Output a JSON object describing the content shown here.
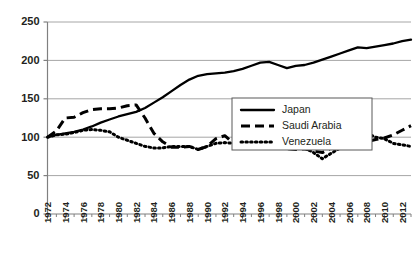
{
  "chart_data": {
    "type": "line",
    "title": "",
    "xlabel": "",
    "ylabel": "",
    "xlim": [
      1972,
      2013
    ],
    "ylim": [
      0,
      250
    ],
    "grid": true,
    "y_ticks": [
      0,
      50,
      100,
      150,
      200,
      250
    ],
    "x_ticks": [
      1972,
      1974,
      1976,
      1978,
      1980,
      1982,
      1984,
      1986,
      1988,
      1990,
      1992,
      1994,
      1996,
      1998,
      2000,
      2002,
      2004,
      2006,
      2008,
      2010,
      2012
    ],
    "x": [
      1972,
      1973,
      1974,
      1975,
      1976,
      1977,
      1978,
      1979,
      1980,
      1981,
      1982,
      1983,
      1984,
      1985,
      1986,
      1987,
      1988,
      1989,
      1990,
      1991,
      1992,
      1993,
      1994,
      1995,
      1996,
      1997,
      1998,
      1999,
      2000,
      2001,
      2002,
      2003,
      2004,
      2005,
      2006,
      2007,
      2008,
      2009,
      2010,
      2011,
      2012,
      2013
    ],
    "legend_position": "center-right",
    "series": [
      {
        "name": "Japan",
        "style": "solid",
        "color": "#000000",
        "values": [
          100,
          103,
          105,
          107,
          110,
          114,
          119,
          123,
          127,
          130,
          133,
          138,
          145,
          152,
          160,
          168,
          175,
          180,
          182,
          183,
          184,
          186,
          189,
          193,
          197,
          198,
          194,
          190,
          193,
          194,
          197,
          201,
          205,
          209,
          213,
          217,
          216,
          218,
          220,
          222,
          225,
          227
        ]
      },
      {
        "name": "Saudi Arabia",
        "style": "dashed",
        "color": "#000000",
        "values": [
          100,
          108,
          125,
          126,
          132,
          136,
          137,
          137,
          138,
          141,
          142,
          125,
          105,
          94,
          87,
          87,
          88,
          84,
          88,
          98,
          102,
          92,
          89,
          89,
          87,
          88,
          88,
          85,
          84,
          85,
          82,
          80,
          86,
          88,
          90,
          92,
          94,
          97,
          99,
          103,
          109,
          115
        ]
      },
      {
        "name": "Venezuela",
        "style": "dotted",
        "color": "#000000",
        "values": [
          100,
          103,
          104,
          106,
          109,
          110,
          109,
          107,
          100,
          96,
          92,
          88,
          86,
          86,
          88,
          88,
          88,
          84,
          88,
          92,
          93,
          92,
          90,
          89,
          90,
          91,
          88,
          86,
          85,
          86,
          80,
          72,
          79,
          86,
          93,
          101,
          105,
          100,
          98,
          92,
          90,
          88
        ]
      }
    ]
  },
  "legend": {
    "items": [
      {
        "label": "Japan",
        "style": "solid"
      },
      {
        "label": "Saudi Arabia",
        "style": "dashed"
      },
      {
        "label": "Venezuela",
        "style": "dotted"
      }
    ]
  },
  "axes": {
    "y_tick_labels": [
      "250",
      "200",
      "150",
      "100",
      "50",
      "0"
    ],
    "x_tick_labels": [
      "1972",
      "1974",
      "1976",
      "1978",
      "1980",
      "1982",
      "1984",
      "1986",
      "1988",
      "1990",
      "1992",
      "1994",
      "1996",
      "1998",
      "2000",
      "2002",
      "2004",
      "2006",
      "2008",
      "2010",
      "2012"
    ]
  },
  "colors": {
    "axis": "#808080",
    "grid": "#a6a6a6",
    "line": "#000000",
    "text": "#231f20"
  }
}
